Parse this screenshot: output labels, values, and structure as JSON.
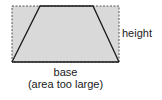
{
  "diagram": {
    "labels": {
      "height": "height",
      "base": "base",
      "note": "(area too large)"
    },
    "shapes": {
      "rectangle": {
        "x": 12,
        "y": 6,
        "width": 107,
        "height": 56,
        "style": "dashed",
        "fill": "#d9d9d9"
      },
      "trapezoid": {
        "points": [
          [
            12,
            62
          ],
          [
            40,
            6
          ],
          [
            93,
            6
          ],
          [
            119,
            62
          ]
        ],
        "style": "solid"
      }
    },
    "colors": {
      "fill": "#d9d9d9",
      "stroke": "#1a1a1a",
      "dashed": "#555555"
    }
  }
}
